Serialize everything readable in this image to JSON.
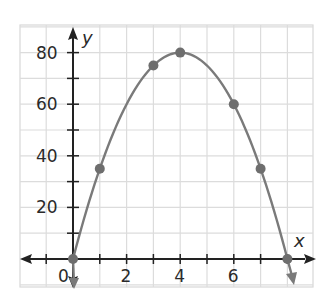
{
  "chart_data": {
    "type": "line",
    "title": "",
    "xlabel": "x",
    "ylabel": "y",
    "x": [
      0,
      1,
      3,
      4,
      6,
      7,
      8
    ],
    "series": [
      {
        "name": "y = -5x^2 + 40x",
        "values": [
          0,
          35,
          75,
          80,
          60,
          35,
          0
        ],
        "markers": true,
        "curve": "parabola",
        "color": "#7a7a7a"
      }
    ],
    "x_ticks": [
      0,
      2,
      4,
      6
    ],
    "x_tick_labels": [
      "0",
      "2",
      "4",
      "6"
    ],
    "y_ticks": [
      20,
      40,
      60,
      80
    ],
    "y_tick_labels": [
      "20",
      "40",
      "60",
      "80"
    ],
    "xlim": [
      -2,
      9
    ],
    "ylim": [
      -10,
      90
    ],
    "grid": true,
    "grid_color": "#dcdcdc",
    "axis_color": "#222222",
    "legend": null
  }
}
